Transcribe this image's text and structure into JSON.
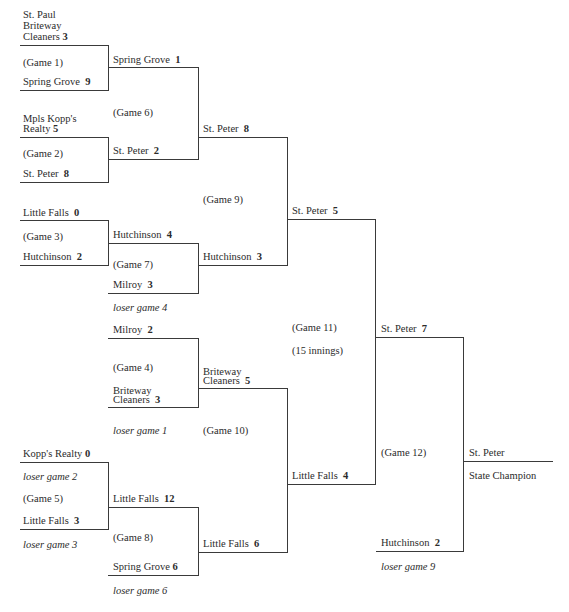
{
  "games": [
    {
      "id": "game-1",
      "label": "(Game 1)",
      "team_a": {
        "line1": "St. Paul",
        "line2": "Briteway",
        "line3": "Cleaners",
        "score": "3"
      },
      "team_b": {
        "name": "Spring Grove",
        "score": "9"
      }
    },
    {
      "id": "game-2",
      "label": "(Game 2)",
      "team_a": {
        "line1": "Mpls Kopp's",
        "line2": "Realty",
        "score": "5"
      },
      "team_b": {
        "name": "St. Peter",
        "score": "8"
      }
    },
    {
      "id": "game-3",
      "label": "(Game 3)",
      "team_a": {
        "name": "Little Falls",
        "score": "0"
      },
      "team_b": {
        "name": "Hutchinson",
        "score": "2"
      }
    },
    {
      "id": "game-4",
      "label": "(Game 4)",
      "team_a": {
        "name": "Milroy",
        "score": "2"
      },
      "team_b": {
        "line1": "Briteway",
        "line2": "Cleaners",
        "score": "3"
      },
      "note": "loser game 1"
    },
    {
      "id": "game-5",
      "label": "(Game 5)",
      "team_a": {
        "name": "Kopp's Realty",
        "score": "0"
      },
      "team_a_note": "loser game 2",
      "team_b": {
        "name": "Little Falls",
        "score": "3"
      },
      "note": "loser game 3"
    },
    {
      "id": "game-6",
      "label": "(Game 6)",
      "team_a": {
        "name": "Spring Grove",
        "score": "1"
      },
      "team_b": {
        "name": "St. Peter",
        "score": "2"
      }
    },
    {
      "id": "game-7",
      "label": "(Game 7)",
      "team_a": {
        "name": "Hutchinson",
        "score": "4"
      },
      "team_b": {
        "name": "Milroy",
        "score": "3"
      },
      "note": "loser game 4"
    },
    {
      "id": "game-8",
      "label": "(Game 8)",
      "team_a": {
        "name": "Little Falls",
        "score": "12"
      },
      "team_b": {
        "name": "Spring Grove",
        "score": "6"
      },
      "note": "loser game 6"
    },
    {
      "id": "game-9",
      "label": "(Game 9)",
      "team_a": {
        "name": "St. Peter",
        "score": "8"
      },
      "team_b": {
        "name": "Hutchinson",
        "score": "3"
      }
    },
    {
      "id": "game-10",
      "label": "(Game 10)",
      "team_a": {
        "line1": "Briteway",
        "line2": "Cleaners",
        "score": "5"
      },
      "team_b": {
        "name": "Little Falls",
        "score": "6"
      }
    },
    {
      "id": "game-11",
      "label": "(Game 11)",
      "extra": "(15 innings)",
      "team_a": {
        "name": "St. Peter",
        "score": "5"
      },
      "team_b": {
        "name": "Little Falls",
        "score": "4"
      }
    },
    {
      "id": "game-12",
      "label": "(Game 12)",
      "team_a": {
        "name": "St. Peter",
        "score": "7"
      },
      "team_b": {
        "name": "Hutchinson",
        "score": "2"
      },
      "note": "loser game 9"
    }
  ],
  "champion": {
    "name": "St. Peter",
    "title": "State Champion"
  }
}
